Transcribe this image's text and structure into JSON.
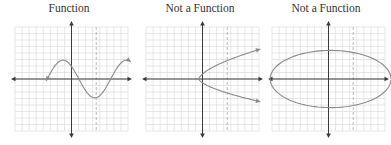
{
  "colors": {
    "grid": "#d6d6d6",
    "axis": "#3a3a3a",
    "curve": "#8a8a8a",
    "dashed": "#b0b0b0",
    "title": "#333333"
  },
  "chart_data": [
    {
      "type": "line",
      "title": "Function",
      "xlim": [
        -8,
        8
      ],
      "ylim": [
        -8,
        8
      ],
      "grid": true,
      "dashed_vertical_x": 3.5,
      "curve": {
        "kind": "sine",
        "amplitude": 2.9,
        "period": 9,
        "phase_peak_x": -1.2,
        "x_range": [
          -3.6,
          8.4
        ],
        "arrows": "both"
      }
    },
    {
      "type": "line",
      "title": "Not a Function",
      "xlim": [
        -8,
        8
      ],
      "ylim": [
        -8,
        8
      ],
      "grid": true,
      "dashed_vertical_x": 3.5,
      "curve": {
        "kind": "sideways-parabola",
        "vertex": [
          -0.5,
          0
        ],
        "y_range": [
          -3.5,
          4.6
        ],
        "arrows": "both"
      }
    },
    {
      "type": "line",
      "title": "Not a Function",
      "xlim": [
        -8,
        8
      ],
      "ylim": [
        -8,
        8
      ],
      "grid": true,
      "dashed_vertical_x": 3.5,
      "curve": {
        "kind": "ellipse",
        "center": [
          0.3,
          0
        ],
        "rx": 9.0,
        "ry": 4.4,
        "arrows": "none"
      }
    }
  ]
}
